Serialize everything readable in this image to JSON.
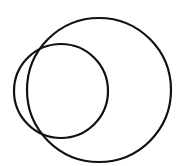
{
  "diagram": {
    "background": "#ffffff",
    "stroke_color": "#111111",
    "stroke_width": 2.2,
    "circles": [
      {
        "name": "large-circle",
        "cx": 99,
        "cy": 90,
        "r": 72
      },
      {
        "name": "small-circle",
        "cx": 61,
        "cy": 91,
        "r": 47
      }
    ]
  }
}
